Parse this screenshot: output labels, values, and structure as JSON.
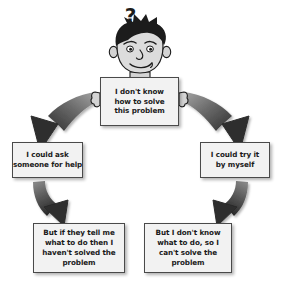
{
  "diagram": {
    "palette": {
      "box_fill": "#f2f2f2",
      "box_border": "#4a4a4a",
      "arrow_dark": "#3a3a3a",
      "arrow_light": "#9a9a9a",
      "text": "#1a1a1a",
      "skin": "#d8d8d8",
      "hair": "#1c1c1c",
      "page_bg": "#ffffff"
    },
    "character": {
      "name": "thinking-boy",
      "thought_symbol": "?",
      "holds_sign": true
    },
    "nodes": [
      {
        "id": "top",
        "name": "statement-box-problem",
        "lines": [
          "I don't know",
          "how to solve",
          "this problem"
        ]
      },
      {
        "id": "left",
        "name": "option-box-ask-someone",
        "lines": [
          "I could ask",
          "someone for help"
        ]
      },
      {
        "id": "right",
        "name": "option-box-try-myself",
        "lines": [
          "I could try it",
          "by myself"
        ]
      },
      {
        "id": "bottom-left",
        "name": "outcome-box-not-solved",
        "lines": [
          "But if they tell me",
          "what to do then I",
          "haven't solved the",
          "problem"
        ]
      },
      {
        "id": "bottom-right",
        "name": "outcome-box-cant-solve",
        "lines": [
          "But I don't know",
          "what to do, so I",
          "can't solve the",
          "problem"
        ]
      }
    ],
    "arrows": [
      {
        "id": "a1",
        "name": "arrow-top-to-left",
        "from": "top",
        "to": "left",
        "style": "curved"
      },
      {
        "id": "a2",
        "name": "arrow-top-to-right",
        "from": "top",
        "to": "right",
        "style": "curved"
      },
      {
        "id": "a3",
        "name": "arrow-left-to-bottom-left",
        "from": "left",
        "to": "bottom-left",
        "style": "curved"
      },
      {
        "id": "a4",
        "name": "arrow-right-to-bottom-right",
        "from": "right",
        "to": "bottom-right",
        "style": "curved"
      }
    ]
  }
}
